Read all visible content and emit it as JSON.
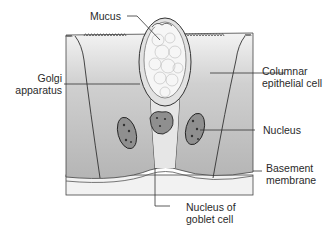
{
  "labels": {
    "mucus": "Mucus",
    "golgi_line1": "Golgi",
    "golgi_line2": "apparatus",
    "columnar_line1": "Columnar",
    "columnar_line2": "epithelial cell",
    "nucleus": "Nucleus",
    "basement_line1": "Basement",
    "basement_line2": "membrane",
    "goblet_nucleus_line1": "Nucleus of",
    "goblet_nucleus_line2": "goblet cell"
  },
  "colors": {
    "cytoplasm_top": "#ececec",
    "cytoplasm_bottom": "#b9b9b9",
    "connective_tissue": "#f2f2f2",
    "mucus": "#f4f4f4",
    "nucleus": "#8f8f8f",
    "outline": "#333333"
  }
}
